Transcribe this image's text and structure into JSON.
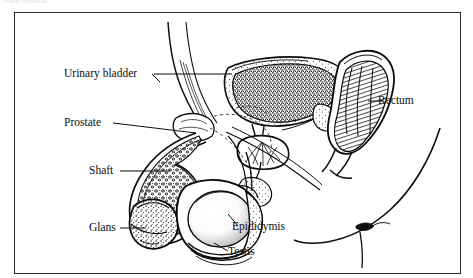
{
  "page": {
    "header_scrap": "Male Genital",
    "background_color": "#ffffff",
    "ink_color": "#111111"
  },
  "figure": {
    "title": "",
    "frame": {
      "border_color": "#2a2a2a",
      "x": 14,
      "y": 12,
      "width": 447,
      "height": 262
    },
    "type": "anatomical-sagittal-section",
    "labels": [
      {
        "key": "urinary_bladder",
        "text": "Urinary bladder",
        "side": "left",
        "leader": "horizontal"
      },
      {
        "key": "prostate",
        "text": "Prostate",
        "side": "left",
        "leader": "horizontal"
      },
      {
        "key": "shaft",
        "text": "Shaft",
        "side": "left",
        "leader": "horizontal"
      },
      {
        "key": "glans",
        "text": "Glans",
        "side": "left",
        "leader": "horizontal"
      },
      {
        "key": "rectum",
        "text": "Rectum",
        "side": "right",
        "leader": "horizontal"
      },
      {
        "key": "epididymis",
        "text": "Epididymis",
        "side": "right",
        "leader": "diagonal"
      },
      {
        "key": "testis",
        "text": "Testis",
        "side": "right",
        "leader": "diagonal"
      }
    ],
    "structures": [
      "abdominal-wall",
      "urinary-bladder",
      "prostate-gland",
      "rectum",
      "penis-shaft",
      "glans-penis",
      "testis",
      "epididymis",
      "scrotum",
      "buttock-outline"
    ]
  }
}
